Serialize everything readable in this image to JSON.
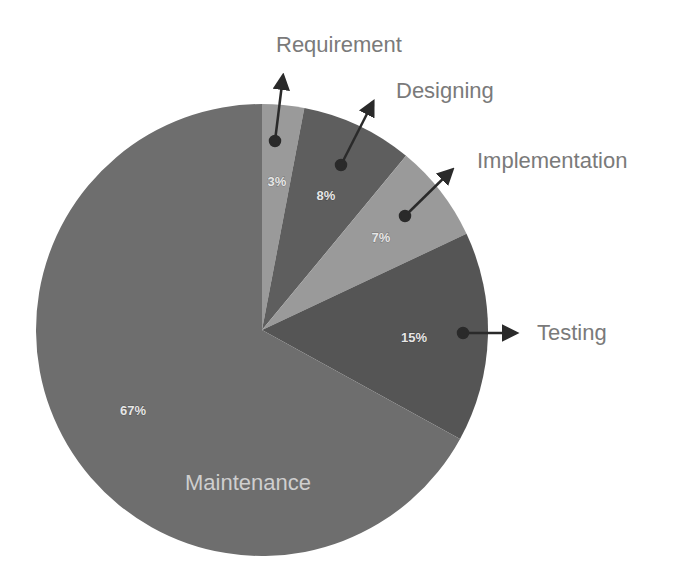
{
  "chart_data": {
    "type": "pie",
    "title": "",
    "categories": [
      "Requirement",
      "Designing",
      "Implementation",
      "Testing",
      "Maintenance"
    ],
    "values": [
      3,
      8,
      7,
      15,
      67
    ],
    "value_labels": [
      "3%",
      "8%",
      "7%",
      "15%",
      "67%"
    ],
    "colors": [
      "#9a9a9a",
      "#5e5e5e",
      "#9a9a9a",
      "#555555",
      "#6e6e6e"
    ],
    "legend": "none (callout labels with arrows)",
    "start_angle_deg": 0,
    "direction": "clockwise"
  },
  "labels": {
    "requirement": "Requirement",
    "designing": "Designing",
    "implementation": "Implementation",
    "testing": "Testing",
    "maintenance": "Maintenance"
  },
  "percents": {
    "requirement": "3%",
    "designing": "8%",
    "implementation": "7%",
    "testing": "15%",
    "maintenance": "67%"
  }
}
